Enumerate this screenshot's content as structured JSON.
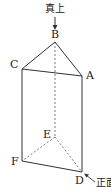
{
  "figure": {
    "type": "triangular-prism",
    "annotations": {
      "top_view_label": "真上",
      "front_view_label": "正面"
    },
    "vertices": {
      "A": {
        "label": "A",
        "x": 82,
        "y": 76
      },
      "B": {
        "label": "B",
        "x": 55,
        "y": 42
      },
      "C": {
        "label": "C",
        "x": 22,
        "y": 69
      },
      "D": {
        "label": "D",
        "x": 82,
        "y": 172
      },
      "E": {
        "label": "E",
        "x": 55,
        "y": 137
      },
      "F": {
        "label": "F",
        "x": 22,
        "y": 161
      }
    },
    "edges_solid": [
      "AB",
      "BC",
      "CA",
      "CF",
      "AD",
      "FD"
    ],
    "edges_hidden": [
      "BE",
      "EF",
      "ED"
    ],
    "line_color": "#333333"
  }
}
